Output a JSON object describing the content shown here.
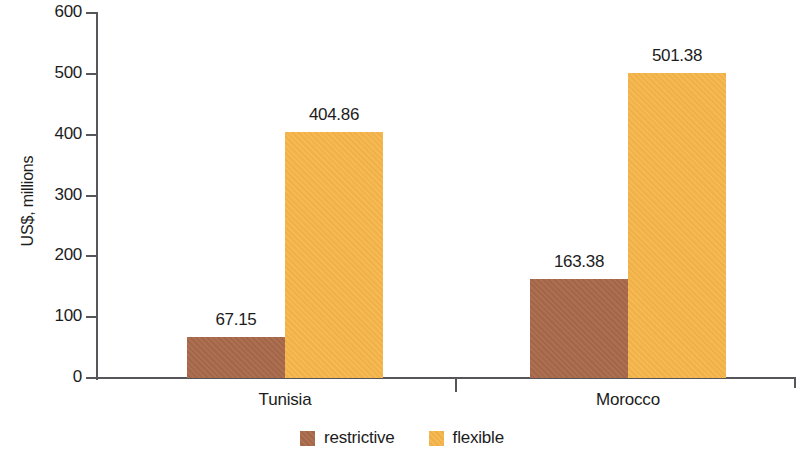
{
  "chart_data": {
    "type": "bar",
    "title": "",
    "subtitle": "",
    "xlabel": "",
    "ylabel": "US$, millions",
    "categories": [
      "Tunisia",
      "Morocco"
    ],
    "series": [
      {
        "name": "restrictive",
        "color": "#a9694a",
        "values": [
          67.15,
          163.38
        ],
        "labels": [
          "67.15",
          "163.38"
        ]
      },
      {
        "name": "flexible",
        "color": "#f5b54a",
        "values": [
          404.86,
          501.38
        ],
        "labels": [
          "404.86",
          "501.38"
        ]
      }
    ],
    "ylim": [
      0,
      600
    ],
    "ytick_values": [
      0,
      100,
      200,
      300,
      400,
      500,
      600
    ],
    "ytick_labels": [
      "0",
      "100",
      "200",
      "300",
      "400",
      "500",
      "600"
    ],
    "grid": false,
    "legend_position": "bottom",
    "annotations": []
  },
  "axis": {
    "y_title": "US$, millions",
    "ticks": [
      {
        "label": "600",
        "value": 600
      },
      {
        "label": "500",
        "value": 500
      },
      {
        "label": "400",
        "value": 400
      },
      {
        "label": "300",
        "value": 300
      },
      {
        "label": "200",
        "value": 200
      },
      {
        "label": "100",
        "value": 100
      },
      {
        "label": "0",
        "value": 0
      }
    ]
  },
  "groups": [
    {
      "label": "Tunisia",
      "bars": [
        {
          "series": "restrictive",
          "value": 67.15,
          "label": "67.15"
        },
        {
          "series": "flexible",
          "value": 404.86,
          "label": "404.86"
        }
      ]
    },
    {
      "label": "Morocco",
      "bars": [
        {
          "series": "restrictive",
          "value": 163.38,
          "label": "163.38"
        },
        {
          "series": "flexible",
          "value": 501.38,
          "label": "501.38"
        }
      ]
    }
  ],
  "legend": {
    "items": [
      {
        "label": "restrictive",
        "color": "#a9694a"
      },
      {
        "label": "flexible",
        "color": "#f5b54a"
      }
    ]
  },
  "colors": {
    "restrictive": "#a9694a",
    "flexible": "#f5b54a",
    "axis": "#56565a",
    "text": "#1c1c1c",
    "background": "#ffffff"
  }
}
